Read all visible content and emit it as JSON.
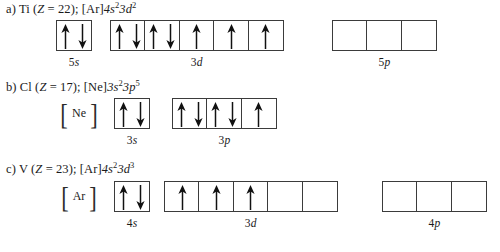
{
  "figure": {
    "background": "#ffffff",
    "ink": "#1a1a1a",
    "box_border": "#3b3b3b"
  },
  "entries": [
    {
      "key": "a",
      "label": "a)",
      "element": "Ti",
      "z_text": "(Z = 22);",
      "z_prefix": "(",
      "z_symbol": "Z",
      "z_value": "= 22);",
      "configuration": "[Ar]4s23d2",
      "core": "[Ar]",
      "sub1": "4s",
      "sup1": "2",
      "sub2": "3d",
      "sup2": "2",
      "groups": [
        {
          "name": "5s",
          "caption_num": "5",
          "caption_letter": "s",
          "boxes": [
            {
              "arrows": [
                "up",
                "down"
              ]
            }
          ]
        },
        {
          "name": "3d",
          "caption_num": "3",
          "caption_letter": "d",
          "boxes": [
            {
              "arrows": [
                "up",
                "down"
              ]
            },
            {
              "arrows": [
                "up",
                "down"
              ]
            },
            {
              "arrows": [
                "up"
              ]
            },
            {
              "arrows": [
                "up"
              ]
            },
            {
              "arrows": [
                "up"
              ]
            }
          ]
        },
        {
          "name": "5p",
          "caption_num": "5",
          "caption_letter": "p",
          "boxes": [
            {
              "arrows": []
            },
            {
              "arrows": []
            },
            {
              "arrows": []
            }
          ]
        }
      ]
    },
    {
      "key": "b",
      "label": "b)",
      "element": "Cl",
      "z_symbol": "Z",
      "z_value": "= 17);",
      "z_prefix": "(",
      "configuration": "[Ne]3s23p5",
      "core": "[Ne]",
      "core_symbol": "Ne",
      "sub1": "3s",
      "sup1": "2",
      "sub2": "3p",
      "sup2": "5",
      "groups": [
        {
          "name": "3s",
          "caption_num": "3",
          "caption_letter": "s",
          "boxes": [
            {
              "arrows": [
                "up",
                "down"
              ]
            }
          ]
        },
        {
          "name": "3p",
          "caption_num": "3",
          "caption_letter": "p",
          "boxes": [
            {
              "arrows": [
                "up",
                "down"
              ]
            },
            {
              "arrows": [
                "up",
                "down"
              ]
            },
            {
              "arrows": [
                "up"
              ]
            }
          ]
        }
      ]
    },
    {
      "key": "c",
      "label": "c)",
      "element": "V",
      "z_symbol": "Z",
      "z_value": "= 23);",
      "z_prefix": "(",
      "configuration": "[Ar]4s23d3",
      "core": "[Ar]",
      "core_symbol": "Ar",
      "sub1": "4s",
      "sup1": "2",
      "sub2": "3d",
      "sup2": "3",
      "groups": [
        {
          "name": "4s",
          "caption_num": "4",
          "caption_letter": "s",
          "boxes": [
            {
              "arrows": [
                "up",
                "down"
              ]
            }
          ]
        },
        {
          "name": "3d",
          "caption_num": "3",
          "caption_letter": "d",
          "boxes": [
            {
              "arrows": [
                "up"
              ]
            },
            {
              "arrows": [
                "up"
              ]
            },
            {
              "arrows": [
                "up"
              ]
            },
            {
              "arrows": []
            },
            {
              "arrows": []
            }
          ]
        },
        {
          "name": "4p",
          "caption_num": "4",
          "caption_letter": "p",
          "boxes": [
            {
              "arrows": []
            },
            {
              "arrows": []
            },
            {
              "arrows": []
            }
          ]
        }
      ]
    }
  ],
  "brackets": {
    "left": "[",
    "right": "]"
  }
}
